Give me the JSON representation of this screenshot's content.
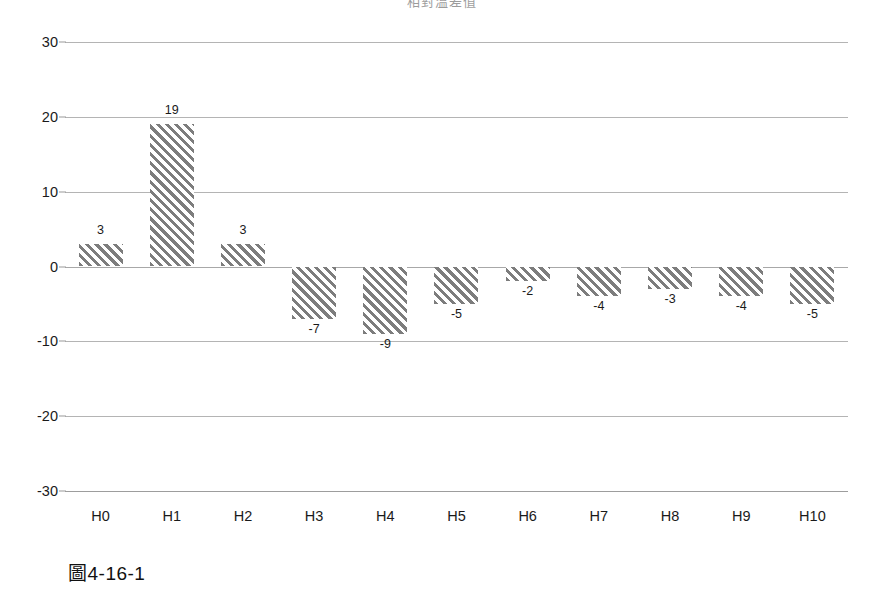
{
  "caption": "圖4-16-1",
  "chart_data": {
    "type": "bar",
    "title": "相對溫差值",
    "xlabel": "",
    "ylabel": "",
    "categories": [
      "H0",
      "H1",
      "H2",
      "H3",
      "H4",
      "H5",
      "H6",
      "H7",
      "H8",
      "H9",
      "H10"
    ],
    "values": [
      3,
      19,
      3,
      -7,
      -9,
      -5,
      -2,
      -4,
      -3,
      -4,
      -5
    ],
    "value_labels": [
      "3",
      "19",
      "3",
      "-7",
      "-9",
      "-5",
      "-2",
      "-4",
      "-3",
      "-4",
      "-5"
    ],
    "ylim": [
      -30,
      30
    ],
    "yticks": [
      30,
      20,
      10,
      0,
      -10,
      -20,
      -30
    ],
    "ytick_labels": [
      "30",
      "20",
      "10",
      "0",
      "-10",
      "-20",
      "-30"
    ],
    "grid": true,
    "legend": false,
    "legend_position": "none",
    "bar_style": "diagonal-hatch",
    "bar_color": "#7d7d7d",
    "gridline_color": "#b4b4b4",
    "background_color": "#ffffff"
  }
}
